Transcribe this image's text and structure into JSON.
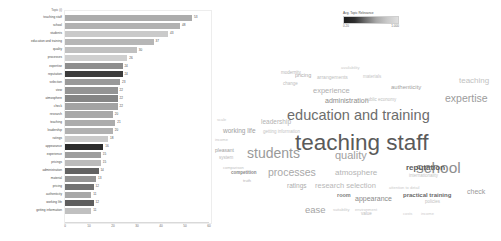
{
  "chart_data": {
    "type": "bar",
    "orientation": "horizontal",
    "title": "",
    "xlabel": "",
    "ylabel": "Topic",
    "topic_header": "Topic (i)",
    "xlim": [
      0,
      60
    ],
    "xticks": [
      "0",
      "10",
      "20",
      "30",
      "40",
      "50",
      "60"
    ],
    "grid": false,
    "categories": [
      "teaching staff",
      "school",
      "students",
      "education and training",
      "quality",
      "processes",
      "expertise",
      "reputation",
      "selection",
      "view",
      "atmosphere",
      "check",
      "research",
      "teaching",
      "leadership",
      "ratings",
      "appearance",
      "experience",
      "pricings",
      "administration",
      "material",
      "pricing",
      "authenticity",
      "working life",
      "getting information"
    ],
    "values": [
      53,
      48,
      43,
      37,
      30,
      26,
      24,
      24,
      23,
      22,
      22,
      22,
      20,
      21,
      20,
      18,
      16,
      15,
      15,
      14,
      13,
      12,
      11,
      12,
      11
    ],
    "relevance": [
      0.42,
      0.4,
      0.3,
      0.38,
      0.34,
      0.28,
      0.55,
      0.88,
      0.5,
      0.52,
      0.58,
      0.46,
      0.44,
      0.42,
      0.4,
      0.3,
      0.95,
      0.48,
      0.36,
      0.72,
      0.52,
      0.66,
      0.44,
      0.74,
      0.34
    ]
  },
  "legend": {
    "title": "Avg. Topic Relevance",
    "min": "0.20",
    "max": "1.000"
  },
  "word_cloud": {
    "type": "wordcloud",
    "words": [
      {
        "text": "teaching staff",
        "size": 22.5,
        "x": 82,
        "y": 92,
        "color": "#5a5a5a",
        "weight": "normal"
      },
      {
        "text": "education and training",
        "size": 14.5,
        "x": 74,
        "y": 68,
        "color": "#6d6d6d",
        "weight": "normal"
      },
      {
        "text": "students",
        "size": 14.0,
        "x": 34,
        "y": 106,
        "color": "#9a9a9a",
        "weight": "normal"
      },
      {
        "text": "school",
        "size": 15.5,
        "x": 203,
        "y": 120,
        "color": "#8e8e8e",
        "weight": "normal"
      },
      {
        "text": "quality",
        "size": 11.0,
        "x": 122,
        "y": 110,
        "color": "#a0a0a0",
        "weight": "normal"
      },
      {
        "text": "processes",
        "size": 10.5,
        "x": 55,
        "y": 127,
        "color": "#a8a8a8",
        "weight": "normal"
      },
      {
        "text": "atmosphere",
        "size": 8.0,
        "x": 122,
        "y": 129,
        "color": "#b4b4b4",
        "weight": "normal"
      },
      {
        "text": "reputation",
        "size": 8.0,
        "x": 193,
        "y": 124,
        "color": "#5c5c5c",
        "weight": "bold"
      },
      {
        "text": "expertise",
        "size": 10.5,
        "x": 232,
        "y": 53,
        "color": "#9c9c9c",
        "weight": "normal"
      },
      {
        "text": "administration",
        "size": 7.0,
        "x": 112,
        "y": 57,
        "color": "#8c8c8c",
        "weight": "normal"
      },
      {
        "text": "experience",
        "size": 7.5,
        "x": 100,
        "y": 47,
        "color": "#b0b0b0",
        "weight": "normal"
      },
      {
        "text": "research selection",
        "size": 7.5,
        "x": 102,
        "y": 142,
        "color": "#b8b8b8",
        "weight": "normal"
      },
      {
        "text": "ratings",
        "size": 6.5,
        "x": 74,
        "y": 143,
        "color": "#adadad",
        "weight": "normal"
      },
      {
        "text": "practical training",
        "size": 6.0,
        "x": 190,
        "y": 152,
        "color": "#6a6a6a",
        "weight": "bold"
      },
      {
        "text": "check",
        "size": 7.0,
        "x": 254,
        "y": 148,
        "color": "#9a9a9a",
        "weight": "normal"
      },
      {
        "text": "appearance",
        "size": 7.0,
        "x": 142,
        "y": 155,
        "color": "#8a8a8a",
        "weight": "normal"
      },
      {
        "text": "ease",
        "size": 9.5,
        "x": 92,
        "y": 165,
        "color": "#a4a4a4",
        "weight": "normal"
      },
      {
        "text": "working life",
        "size": 6.5,
        "x": 10,
        "y": 88,
        "color": "#9e9e9e",
        "weight": "normal"
      },
      {
        "text": "leadership",
        "size": 6.5,
        "x": 48,
        "y": 79,
        "color": "#b2b2b2",
        "weight": "normal"
      },
      {
        "text": "teaching",
        "size": 8.0,
        "x": 246,
        "y": 37,
        "color": "#c2c2c2",
        "weight": "normal"
      },
      {
        "text": "authenticity",
        "size": 6.0,
        "x": 178,
        "y": 44,
        "color": "#a2a2a2",
        "weight": "normal"
      },
      {
        "text": "pricing",
        "size": 5.5,
        "x": 82,
        "y": 33,
        "color": "#aaaaaa",
        "weight": "normal"
      },
      {
        "text": "arrangements",
        "size": 5.0,
        "x": 104,
        "y": 35,
        "color": "#c0c0c0",
        "weight": "normal"
      },
      {
        "text": "modernity",
        "size": 4.5,
        "x": 68,
        "y": 31,
        "color": "#b6b6b6",
        "weight": "normal"
      },
      {
        "text": "availability",
        "size": 4.0,
        "x": 128,
        "y": 26,
        "color": "#cacaca",
        "weight": "normal"
      },
      {
        "text": "materials",
        "size": 4.5,
        "x": 150,
        "y": 35,
        "color": "#c6c6c6",
        "weight": "normal"
      },
      {
        "text": "public economy",
        "size": 4.5,
        "x": 152,
        "y": 58,
        "color": "#c0c0c0",
        "weight": "normal"
      },
      {
        "text": "getting information",
        "size": 4.5,
        "x": 50,
        "y": 90,
        "color": "#c4c4c4",
        "weight": "normal"
      },
      {
        "text": "competition",
        "size": 4.5,
        "x": 18,
        "y": 131,
        "color": "#8a8a8a",
        "weight": "bold"
      },
      {
        "text": "truth",
        "size": 4.0,
        "x": 30,
        "y": 139,
        "color": "#b0b0b0",
        "weight": "normal"
      },
      {
        "text": "pleasant",
        "size": 5.0,
        "x": 2,
        "y": 108,
        "color": "#9e9e9e",
        "weight": "normal"
      },
      {
        "text": "system",
        "size": 4.5,
        "x": 6,
        "y": 116,
        "color": "#b8b8b8",
        "weight": "normal"
      },
      {
        "text": "suitability",
        "size": 4.0,
        "x": 120,
        "y": 168,
        "color": "#c6c6c6",
        "weight": "normal"
      },
      {
        "text": "value",
        "size": 4.5,
        "x": 148,
        "y": 172,
        "color": "#bcbcbc",
        "weight": "normal"
      },
      {
        "text": "room",
        "size": 5.5,
        "x": 124,
        "y": 153,
        "color": "#7e7e7e",
        "weight": "bold"
      },
      {
        "text": "policies",
        "size": 4.5,
        "x": 212,
        "y": 160,
        "color": "#c2c2c2",
        "weight": "normal"
      },
      {
        "text": "environment",
        "size": 4.0,
        "x": 142,
        "y": 168,
        "color": "#c8c8c8",
        "weight": "normal"
      },
      {
        "text": "internationality",
        "size": 4.5,
        "x": 196,
        "y": 134,
        "color": "#c4c4c4",
        "weight": "normal"
      },
      {
        "text": "attention to detail",
        "size": 4.0,
        "x": 176,
        "y": 146,
        "color": "#cacaca",
        "weight": "normal"
      },
      {
        "text": "comparison",
        "size": 4.0,
        "x": 10,
        "y": 126,
        "color": "#c0c0c0",
        "weight": "normal"
      },
      {
        "text": "change",
        "size": 4.5,
        "x": 70,
        "y": 42,
        "color": "#bebebe",
        "weight": "normal"
      },
      {
        "text": "income",
        "size": 4.0,
        "x": 2,
        "y": 98,
        "color": "#c4c4c4",
        "weight": "normal"
      },
      {
        "text": "scale",
        "size": 4.0,
        "x": 4,
        "y": 78,
        "color": "#c8c8c8",
        "weight": "normal"
      },
      {
        "text": "costs",
        "size": 4.0,
        "x": 190,
        "y": 172,
        "color": "#cccccc",
        "weight": "normal"
      },
      {
        "text": "income",
        "size": 4.0,
        "x": 208,
        "y": 172,
        "color": "#cccccc",
        "weight": "normal"
      }
    ]
  }
}
